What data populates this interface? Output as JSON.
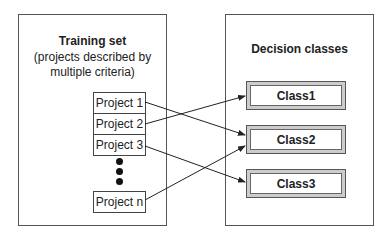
{
  "training_set": {
    "title": "Training set",
    "subtitle_line1": "(projects described by",
    "subtitle_line2": "multiple criteria)",
    "projects": [
      "Project 1",
      "Project 2",
      "Project 3",
      "Project n"
    ]
  },
  "decision_classes": {
    "title": "Decision classes",
    "classes": [
      "Class1",
      "Class2",
      "Class3"
    ]
  },
  "mappings": [
    {
      "from": "Project 1",
      "to": "Class2"
    },
    {
      "from": "Project 2",
      "to": "Class1"
    },
    {
      "from": "Project 3",
      "to": "Class3"
    },
    {
      "from": "Project n",
      "to": "Class2"
    }
  ]
}
